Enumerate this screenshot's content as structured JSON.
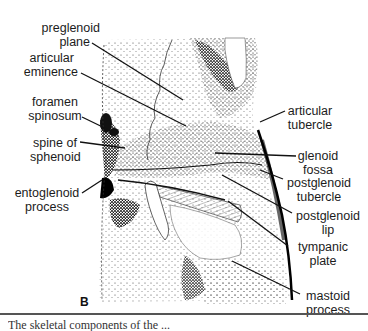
{
  "figure": {
    "panel_letter": "B",
    "caption_fragment": "The skeletal components of the ...",
    "labels_left": [
      {
        "id": "preglenoid-plane",
        "lines": [
          "preglenoid",
          "plane"
        ]
      },
      {
        "id": "articular-eminence",
        "lines": [
          "articular",
          "eminence"
        ]
      },
      {
        "id": "foramen-spinosum",
        "lines": [
          "foramen",
          "spinosum"
        ]
      },
      {
        "id": "spine-of-sphenoid",
        "lines": [
          "spine of",
          "sphenoid"
        ]
      },
      {
        "id": "entoglenoid-process",
        "lines": [
          "entoglenoid",
          "process"
        ]
      }
    ],
    "labels_right": [
      {
        "id": "articular-tubercle",
        "lines": [
          "articular",
          "tubercle"
        ]
      },
      {
        "id": "glenoid-fossa",
        "lines": [
          "glenoid",
          "fossa"
        ]
      },
      {
        "id": "postglenoid-tubercle",
        "lines": [
          "postglenoid",
          "tubercle"
        ]
      },
      {
        "id": "postglenoid-lip",
        "lines": [
          "postglenoid",
          "lip"
        ]
      },
      {
        "id": "tympanic-plate",
        "lines": [
          "tympanic",
          "plate"
        ]
      },
      {
        "id": "mastoid-process",
        "lines": [
          "mastoid",
          "process"
        ]
      }
    ],
    "colors": {
      "ink": "#1a1a1a",
      "paper": "#ffffff",
      "rule": "#555555"
    }
  }
}
